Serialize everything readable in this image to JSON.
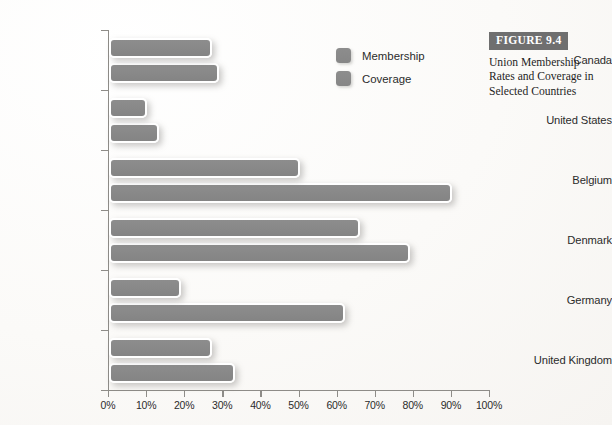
{
  "figure": {
    "number_label": "FIGURE 9.4",
    "caption": "Union Membership Rates and Coverage in Selected Countries"
  },
  "legend": {
    "items": [
      {
        "label": "Membership",
        "color": "#8a8a8a",
        "swatch_name": "membership-swatch"
      },
      {
        "label": "Coverage",
        "color": "#8a8a8a",
        "swatch_name": "coverage-swatch"
      }
    ]
  },
  "axis": {
    "x_tick_labels": [
      "0%",
      "10%",
      "20%",
      "30%",
      "40%",
      "50%",
      "60%",
      "70%",
      "80%",
      "90%",
      "100%"
    ]
  },
  "colors": {
    "bar_fill": "#8a8a8a",
    "bar_border": "#ffffff",
    "axis": "#8e8c88",
    "paper": "#fbfaf8",
    "figure_box": "#6f6f6f",
    "text": "#2b2b2b"
  },
  "chart_data": {
    "type": "bar",
    "orientation": "horizontal",
    "title": "Union Membership Rates and Coverage in Selected Countries",
    "xlabel": "",
    "ylabel": "",
    "xlim": [
      0,
      100
    ],
    "xtick_step": 10,
    "grid": false,
    "legend_position": "top-center",
    "value_unit": "percent",
    "categories": [
      "Canada",
      "United States",
      "Belgium",
      "Denmark",
      "Germany",
      "United Kingdom"
    ],
    "series": [
      {
        "name": "Membership",
        "values": [
          27,
          10,
          50,
          66,
          19,
          27
        ]
      },
      {
        "name": "Coverage",
        "values": [
          29,
          13,
          90,
          79,
          62,
          33
        ]
      }
    ]
  }
}
